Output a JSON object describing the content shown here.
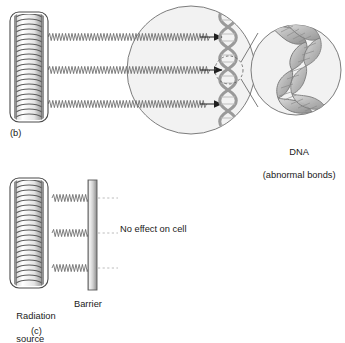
{
  "figure": {
    "type": "scientific-diagram"
  },
  "panels": [
    {
      "tag": "(b)",
      "tag_x": 10,
      "tag_y": 128,
      "description": "Radiation passes through and reaches the cell DNA causing abnormal bonds"
    },
    {
      "tag": "(c)",
      "tag_x": 31,
      "tag_y": 328,
      "description": "Radiation is stopped by a barrier so there is no effect on the cell"
    }
  ],
  "labels": {
    "dna_line1": "DNA",
    "dna_line2": "(abnormal bonds)",
    "dna_x": 262,
    "dna_y": 137,
    "no_effect": "No effect on cell",
    "no_effect_x": 120,
    "no_effect_y": 224,
    "radiation_source_line1": "Radiation",
    "radiation_source_line2": "source",
    "radiation_x": 6,
    "radiation_y": 300,
    "barrier": "Barrier",
    "barrier_x": 74,
    "barrier_y": 300
  },
  "colors": {
    "stroke": "#4a4a4a",
    "stroke_light": "#8c8c8c",
    "cell_fill": "#f2f2f2",
    "cell_stroke": "#6e6e6e",
    "dna_fill": "#c8c8c8",
    "dna_stroke": "#7d7d7d",
    "wave": "#6a6a6a",
    "dotted": "#b4b4b4",
    "barrier_light": "#f0f0f0",
    "barrier_mid": "#b8b8b8",
    "barrier_dark": "#8a8a8a",
    "coil_fill": "#ffffff",
    "coil_stroke": "#6a6a6a",
    "text": "#1a1a1a",
    "background": "#ffffff"
  },
  "panel_b": {
    "source": {
      "x": 10,
      "y": 12,
      "width": 38,
      "height": 110,
      "radius": 9,
      "coil_turns": 22
    },
    "rays": [
      {
        "y": 37,
        "x_start": 48,
        "x_end": 224,
        "arrow": true
      },
      {
        "y": 70,
        "x_start": 48,
        "x_end": 224,
        "arrow": true
      },
      {
        "y": 104,
        "x_start": 48,
        "x_end": 224,
        "arrow": true
      }
    ],
    "cell": {
      "cx": 191,
      "cy": 70,
      "r": 64
    },
    "dna_strand": {
      "x": 228,
      "y_top": 12,
      "y_bottom": 130,
      "coils": 11
    },
    "focus_circle": {
      "cx": 229,
      "cy": 70,
      "r": 14
    },
    "magnified_circle": {
      "cx": 296,
      "cy": 70,
      "r": 45
    },
    "cone_lines": [
      {
        "x1": 241,
        "y1": 61,
        "x2": 256,
        "y2": 35
      },
      {
        "x1": 241,
        "y1": 79,
        "x2": 256,
        "y2": 106
      }
    ]
  },
  "panel_c": {
    "source": {
      "x": 10,
      "y": 178,
      "width": 38,
      "height": 110,
      "radius": 9,
      "coil_turns": 22
    },
    "barrier": {
      "x": 88,
      "y": 180,
      "width": 9,
      "height": 110
    },
    "rays": [
      {
        "y": 198,
        "x_start": 52,
        "x_end": 88
      },
      {
        "y": 233,
        "x_start": 52,
        "x_end": 88
      },
      {
        "y": 268,
        "x_start": 52,
        "x_end": 88
      }
    ],
    "dotted_rays": [
      {
        "y": 198,
        "x_start": 98,
        "x_end": 117
      },
      {
        "y": 233,
        "x_start": 98,
        "x_end": 117
      },
      {
        "y": 268,
        "x_start": 98,
        "x_end": 117
      }
    ]
  }
}
